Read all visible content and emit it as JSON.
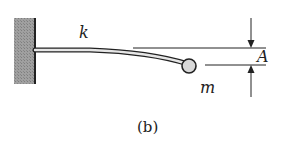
{
  "figure": {
    "caption": "(b)",
    "labels": {
      "stiffness": "k",
      "mass": "m",
      "amplitude": "A"
    }
  },
  "colors": {
    "wall_fill": "#9a9a9a",
    "line": "#222222",
    "mass_fill": "#d8d8d8",
    "beam_fill": "#e6e6e6"
  }
}
